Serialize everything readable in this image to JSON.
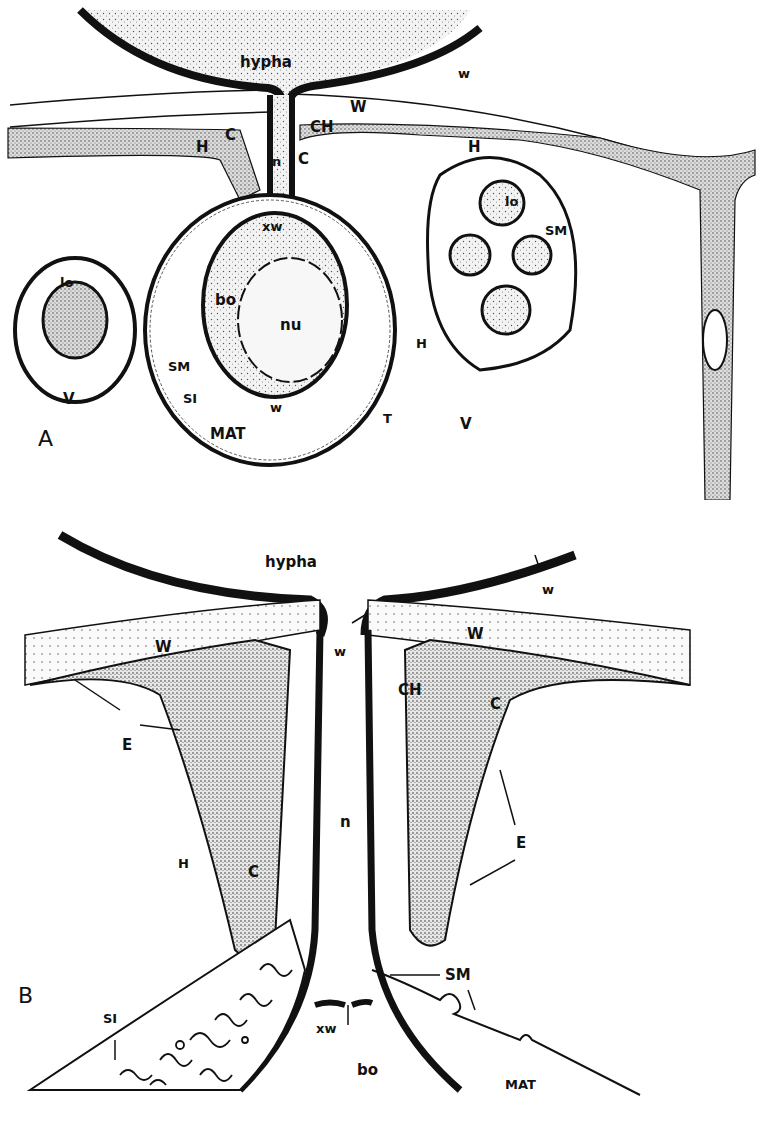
{
  "figure": {
    "panel_a": {
      "panel_label": "A",
      "labels": {
        "hypha": "hypha",
        "w_top": "w",
        "W": "W",
        "CH": "CH",
        "C_left": "C",
        "C_right": "C",
        "n": "n",
        "H_left": "H",
        "H_right": "H",
        "xw": "xw",
        "lo_left": "lo",
        "lo_right": "lo",
        "bo": "bo",
        "nu": "nu",
        "SM_left": "SM",
        "SM_right": "SM",
        "SI": "SI",
        "V_left": "V",
        "V_right": "V",
        "w_bottom": "w",
        "MAT": "MAT",
        "T": "T",
        "H_mid": "H"
      }
    },
    "panel_b": {
      "panel_label": "B",
      "labels": {
        "hypha": "hypha",
        "w_right": "w",
        "w_neck": "w",
        "W_left": "W",
        "W_right": "W",
        "CH": "CH",
        "C_right": "C",
        "E_left": "E",
        "E_right": "E",
        "n": "n",
        "H": "H",
        "C_left": "C",
        "SM": "SM",
        "SI": "SI",
        "xw": "xw",
        "bo": "bo",
        "MAT": "MAT"
      }
    },
    "colors": {
      "ink": "#111111",
      "paper": "#ffffff",
      "stipple": "#e9e9e9"
    }
  }
}
